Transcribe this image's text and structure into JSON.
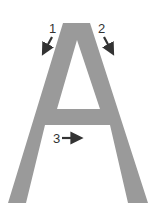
{
  "diagram": {
    "letter": "A",
    "colors": {
      "letter_fill": "#9a9a9a",
      "arrow": "#333333",
      "background": "#ffffff"
    },
    "strokes": [
      {
        "number": "1",
        "direction": "down-left"
      },
      {
        "number": "2",
        "direction": "down-right"
      },
      {
        "number": "3",
        "direction": "right"
      }
    ]
  }
}
